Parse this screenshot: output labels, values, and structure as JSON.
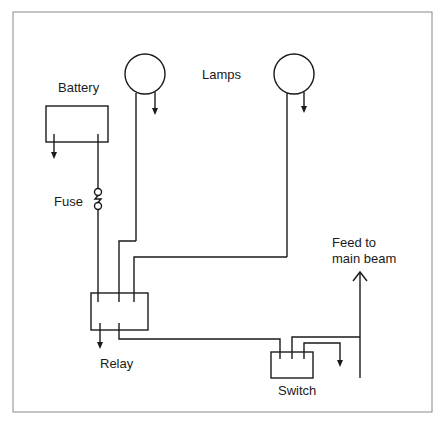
{
  "diagram": {
    "type": "wiring-schematic",
    "title": "",
    "colors": {
      "line": "#1a1a1a",
      "frame": "#8a8a8a",
      "background": "#ffffff"
    },
    "labels": {
      "battery": "Battery",
      "lamps": "Lamps",
      "fuse": "Fuse",
      "relay": "Relay",
      "switch": "Switch",
      "feed_line1": "Feed to",
      "feed_line2": "main beam"
    },
    "components": [
      {
        "id": "battery",
        "label": "Battery",
        "shape": "rectangle"
      },
      {
        "id": "fuse",
        "label": "Fuse",
        "shape": "fuse-symbol"
      },
      {
        "id": "lamp-1",
        "label": "Lamps",
        "shape": "circle"
      },
      {
        "id": "lamp-2",
        "label": "Lamps",
        "shape": "circle"
      },
      {
        "id": "relay",
        "label": "Relay",
        "shape": "rectangle"
      },
      {
        "id": "switch",
        "label": "Switch",
        "shape": "rectangle"
      },
      {
        "id": "feed",
        "label": "Feed to main beam",
        "shape": "arrow-up"
      }
    ],
    "connections": [
      {
        "from": "battery",
        "to": "fuse"
      },
      {
        "from": "fuse",
        "to": "relay"
      },
      {
        "from": "lamp-1",
        "to": "relay"
      },
      {
        "from": "lamp-2",
        "to": "relay"
      },
      {
        "from": "relay",
        "to": "switch"
      },
      {
        "from": "switch",
        "to": "feed"
      },
      {
        "from": "battery",
        "to": "ground"
      },
      {
        "from": "lamp-1",
        "to": "ground"
      },
      {
        "from": "lamp-2",
        "to": "ground"
      },
      {
        "from": "relay",
        "to": "ground"
      },
      {
        "from": "switch",
        "to": "ground"
      }
    ]
  }
}
